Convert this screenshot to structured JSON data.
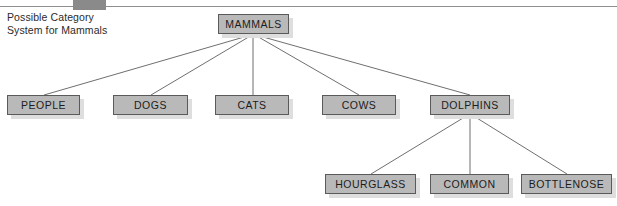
{
  "figure": {
    "caption_line_1": "Possible Category",
    "caption_line_2": "System for Mammals",
    "header_tab_label": "",
    "colors": {
      "node_fill": "#b9b9b9",
      "node_border": "#5a5a5a",
      "node_shadow": "#dedede",
      "connector": "#6f6f6f",
      "rule": "#8e8e8e",
      "tab_marker": "#8a8a8a",
      "text": "#1c1c1c",
      "background": "#ffffff"
    }
  },
  "diagram": {
    "type": "tree",
    "root": "MAMMALS",
    "nodes": [
      {
        "id": "mammals",
        "label": "MAMMALS",
        "level": 0,
        "parent": null
      },
      {
        "id": "people",
        "label": "PEOPLE",
        "level": 1,
        "parent": "mammals"
      },
      {
        "id": "dogs",
        "label": "DOGS",
        "level": 1,
        "parent": "mammals"
      },
      {
        "id": "cats",
        "label": "CATS",
        "level": 1,
        "parent": "mammals"
      },
      {
        "id": "cows",
        "label": "COWS",
        "level": 1,
        "parent": "mammals"
      },
      {
        "id": "dolphins",
        "label": "DOLPHINS",
        "level": 1,
        "parent": "mammals"
      },
      {
        "id": "hourglass",
        "label": "HOURGLASS",
        "level": 2,
        "parent": "dolphins"
      },
      {
        "id": "common",
        "label": "COMMON",
        "level": 2,
        "parent": "dolphins"
      },
      {
        "id": "bottlenose",
        "label": "BOTTLENOSE",
        "level": 2,
        "parent": "dolphins"
      }
    ],
    "edges": [
      {
        "from": "mammals",
        "to": "people"
      },
      {
        "from": "mammals",
        "to": "dogs"
      },
      {
        "from": "mammals",
        "to": "cats"
      },
      {
        "from": "mammals",
        "to": "cows"
      },
      {
        "from": "mammals",
        "to": "dolphins"
      },
      {
        "from": "dolphins",
        "to": "hourglass"
      },
      {
        "from": "dolphins",
        "to": "common"
      },
      {
        "from": "dolphins",
        "to": "bottlenose"
      }
    ]
  }
}
